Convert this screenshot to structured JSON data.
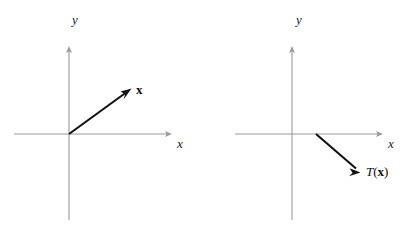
{
  "figure": {
    "background_color": "#ffffff",
    "axis_color": "#9a9a9a",
    "vector_color": "#111111",
    "text_color": "#141414",
    "width": 419,
    "height": 234
  },
  "panels": [
    {
      "id": "left",
      "name": "vector-x-diagram",
      "axes": {
        "x_label": "x",
        "y_label": "y",
        "origin": {
          "x": 69,
          "y": 134
        },
        "x_axis": {
          "from_x": 14,
          "to_x": 172,
          "y": 134
        },
        "y_axis": {
          "x": 69,
          "from_y": 220,
          "to_y": 47
        }
      },
      "vector": {
        "name": "x",
        "label": "x",
        "label_style": "bold",
        "tail": {
          "x": 69,
          "y": 134
        },
        "tip": {
          "x": 131,
          "y": 89
        },
        "label_pos": {
          "x": 136,
          "y": 84
        }
      }
    },
    {
      "id": "right",
      "name": "vector-tx-diagram",
      "axes": {
        "x_label": "x",
        "y_label": "y",
        "origin": {
          "x": 82,
          "y": 134
        },
        "x_axis": {
          "from_x": 25,
          "to_x": 173,
          "y": 134
        },
        "y_axis": {
          "x": 82,
          "from_y": 220,
          "to_y": 47
        }
      },
      "vector": {
        "name": "T(x)",
        "label_function": "T",
        "label_open_paren": "(",
        "label_arg": "x",
        "label_close_paren": ")",
        "label_style": "italic-function-bold-arg",
        "tail": {
          "x": 106,
          "y": 134
        },
        "tip": {
          "x": 150,
          "y": 172
        },
        "label_pos": {
          "x": 156,
          "y": 166
        }
      }
    }
  ]
}
